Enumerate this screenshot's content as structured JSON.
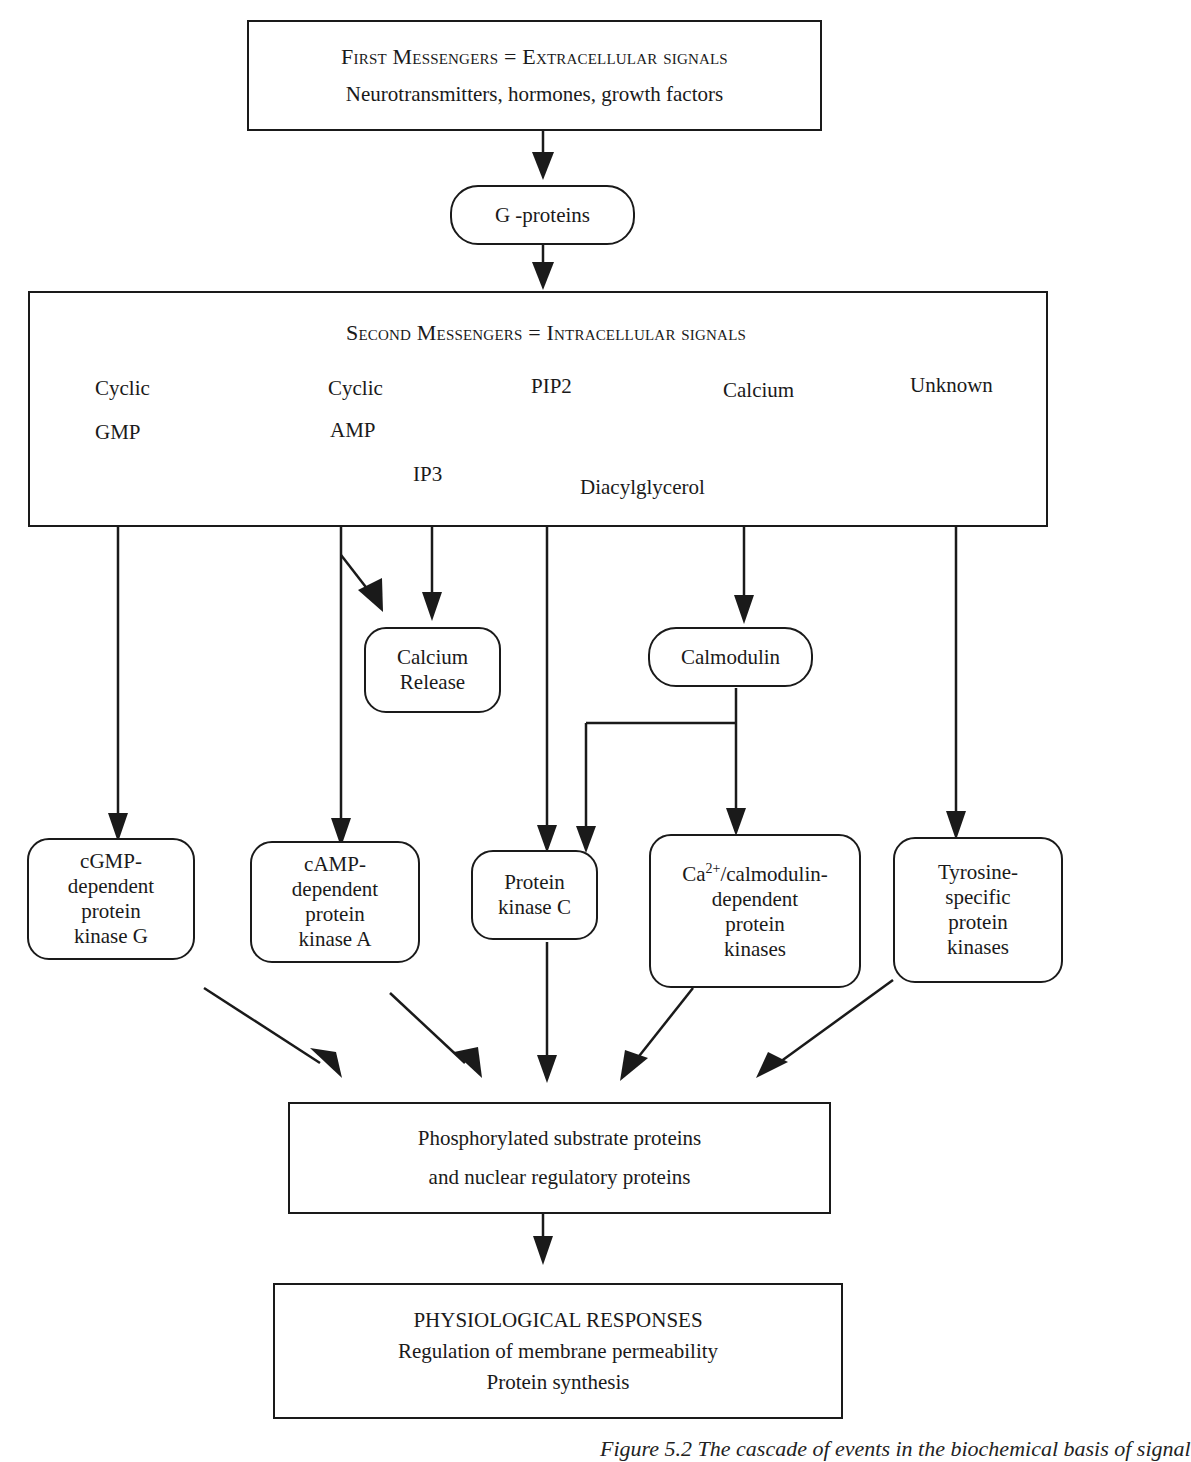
{
  "first_messengers": {
    "title": "First Messengers = Extracellular signals",
    "subtitle": "Neurotransmitters,  hormones,  growth factors"
  },
  "g_proteins": {
    "label": "G -proteins"
  },
  "second_messengers": {
    "title": "Second Messengers = Intracellular signals",
    "items": [
      {
        "id": "cgmp",
        "lines": [
          "Cyclic",
          "GMP"
        ]
      },
      {
        "id": "camp",
        "lines": [
          "Cyclic",
          "AMP"
        ]
      },
      {
        "id": "pip2",
        "lines": [
          "PIP2"
        ]
      },
      {
        "id": "calcium",
        "lines": [
          "Calcium"
        ]
      },
      {
        "id": "unknown",
        "lines": [
          "Unknown"
        ]
      }
    ],
    "pip2_products": {
      "ip3": "IP3",
      "dag": "Diacylglycerol"
    }
  },
  "intermediates": {
    "calcium_release": [
      "Calcium",
      "Release"
    ],
    "calmodulin": "Calmodulin"
  },
  "kinases": [
    {
      "id": "pkg",
      "lines": [
        "cGMP-",
        "dependent",
        "protein",
        "kinase G"
      ]
    },
    {
      "id": "pka",
      "lines": [
        "cAMP-",
        "dependent",
        "protein",
        "kinase A"
      ]
    },
    {
      "id": "pkc",
      "lines": [
        "Protein",
        "kinase C"
      ]
    },
    {
      "id": "camk",
      "lines_html_parts": {
        "ca": "Ca",
        "sup": "2+",
        "rest": "/calmodulin-"
      },
      "lines": [
        "dependent",
        "protein",
        "kinases"
      ]
    },
    {
      "id": "tyrosine",
      "lines": [
        "Tyrosine-",
        "specific",
        "protein",
        "kinases"
      ]
    }
  ],
  "substrates": {
    "lines": [
      "Phosphorylated substrate proteins",
      "and nuclear regulatory proteins"
    ]
  },
  "responses": {
    "title": "PHYSIOLOGICAL RESPONSES",
    "lines": [
      "Regulation of  membrane permeability",
      "Protein synthesis"
    ]
  },
  "caption": "Figure 5.2   The cascade of events in the biochemical basis of signal"
}
